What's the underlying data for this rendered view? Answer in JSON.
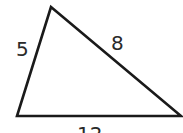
{
  "diagram": {
    "shape": "triangle",
    "stroke_color": "#1a1a1a",
    "vertices": {
      "top": [
        51,
        7
      ],
      "bottom_left": [
        17,
        116
      ],
      "bottom_right": [
        181,
        116
      ]
    },
    "sides": {
      "left": "5",
      "right": "8",
      "bottom": "12"
    }
  }
}
